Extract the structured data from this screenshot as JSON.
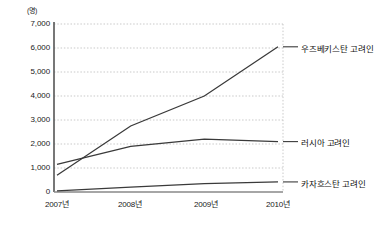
{
  "chart_data": {
    "type": "line",
    "title": "",
    "subtitle": "",
    "xlabel": "",
    "ylabel": "",
    "unit_label": "(명)",
    "categories": [
      "2007년",
      "2008년",
      "2009년",
      "2010년"
    ],
    "x": [
      2007,
      2008,
      2009,
      2010
    ],
    "ylim": [
      0,
      7000
    ],
    "ytick_labels": [
      "7,000",
      "6,000",
      "5,000",
      "4,000",
      "3,000",
      "2,000",
      "1,000",
      "0"
    ],
    "ytick_values": [
      7000,
      6000,
      5000,
      4000,
      3000,
      2000,
      1000,
      0
    ],
    "grid": true,
    "grid_style": "dotted",
    "legend_position": "right-inline-annotations",
    "series": [
      {
        "name": "우즈베키스탄 고려인",
        "values": [
          700,
          2750,
          4000,
          6050
        ],
        "color": "#3a3a3a"
      },
      {
        "name": "러시아 고려인",
        "values": [
          1150,
          1900,
          2200,
          2100
        ],
        "color": "#3a3a3a"
      },
      {
        "name": "카자흐스탄 고려인",
        "values": [
          50,
          200,
          350,
          420
        ],
        "color": "#3a3a3a"
      }
    ]
  },
  "axis": {
    "unit": "(명)",
    "y_labels": [
      "7,000",
      "6,000",
      "5,000",
      "4,000",
      "3,000",
      "2,000",
      "1,000",
      "0"
    ],
    "x_labels": [
      "2007년",
      "2008년",
      "2009년",
      "2010년"
    ]
  },
  "annotations": {
    "series_1_label": "우즈베키스탄 고려인",
    "series_2_label": "러시아 고려인",
    "series_3_label": "카자흐스탄 고려인"
  },
  "colors": {
    "line": "#3a3a3a",
    "axis": "#555555",
    "grid": "#c9c9c9",
    "text": "#1a1a1a"
  }
}
